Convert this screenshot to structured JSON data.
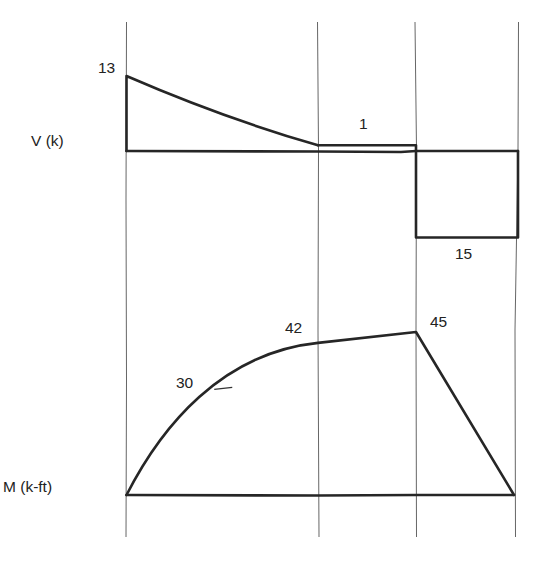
{
  "chart_data": [
    {
      "type": "area",
      "title": "Shear diagram",
      "ylabel": "V (k)",
      "xlabel": "",
      "units": "k",
      "segments": [
        {
          "name": "segment-1",
          "shape": "curved-decreasing",
          "start": 13,
          "end": 1
        },
        {
          "name": "segment-2",
          "shape": "constant",
          "start": 1,
          "end": 1
        },
        {
          "name": "segment-3",
          "shape": "constant",
          "start": -15,
          "end": -15
        }
      ],
      "points": [
        {
          "station": 0,
          "value": 0
        },
        {
          "station": 0,
          "value": 13
        },
        {
          "station": 1,
          "value": 1
        },
        {
          "station": 2,
          "value": 1
        },
        {
          "station": 2,
          "value": -15
        },
        {
          "station": 3,
          "value": -15
        },
        {
          "station": 3,
          "value": 0
        }
      ],
      "annotations": [
        {
          "text": "13",
          "at": "start"
        },
        {
          "text": "1",
          "at": "segment-2"
        },
        {
          "text": "15",
          "at": "segment-3-below"
        }
      ]
    },
    {
      "type": "area",
      "title": "Moment diagram",
      "ylabel": "M (k-ft)",
      "xlabel": "",
      "units": "k-ft",
      "points": [
        {
          "station": 0,
          "value": 0
        },
        {
          "station": 0.5,
          "value": 30
        },
        {
          "station": 1,
          "value": 42
        },
        {
          "station": 2,
          "value": 45
        },
        {
          "station": 3,
          "value": 0
        }
      ],
      "annotations": [
        {
          "text": "30",
          "at": "station-0.5"
        },
        {
          "text": "42",
          "at": "station-1"
        },
        {
          "text": "45",
          "at": "station-2"
        }
      ]
    }
  ],
  "labels": {
    "shear_axis": "V (k)",
    "moment_axis": "M (k-ft)",
    "shear_max": "13",
    "shear_mid": "1",
    "shear_min": "15",
    "moment_30": "30",
    "moment_42": "42",
    "moment_45": "45"
  },
  "stations": [
    0,
    1,
    2,
    3
  ]
}
